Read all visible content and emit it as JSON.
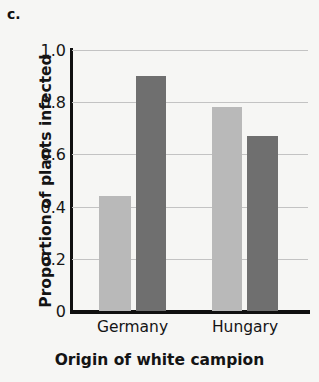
{
  "panel": {
    "label": "c."
  },
  "chart_data": {
    "type": "bar",
    "title": "",
    "subtitle": "",
    "xlabel": "Origin of white campion",
    "ylabel": "Proportion of plants infected",
    "categories": [
      "Germany",
      "Hungary"
    ],
    "series": [
      {
        "name": "light",
        "color": "#b9b9b9",
        "values": [
          0.44,
          0.78
        ]
      },
      {
        "name": "dark",
        "color": "#6f6f6f",
        "values": [
          0.9,
          0.67
        ]
      }
    ],
    "ylim": [
      0,
      1.0
    ],
    "yticks": [
      0,
      0.2,
      0.4,
      0.6,
      0.8,
      1.0
    ],
    "ytick_labels": [
      "0",
      "0.2",
      "0.4",
      "0.6",
      "0.8",
      "1.0"
    ],
    "grid": true,
    "grid_axis": "y",
    "legend": false,
    "legend_position": "none",
    "bars": [
      {
        "category": "Germany",
        "series": "light",
        "value": 0.44,
        "color": "#b9b9b9"
      },
      {
        "category": "Germany",
        "series": "dark",
        "value": 0.9,
        "color": "#6f6f6f"
      },
      {
        "category": "Hungary",
        "series": "light",
        "value": 0.78,
        "color": "#b9b9b9"
      },
      {
        "category": "Hungary",
        "series": "dark",
        "value": 0.67,
        "color": "#6f6f6f"
      }
    ]
  },
  "colors": {
    "background": "#f6f6f4",
    "axis": "#101010",
    "gridline": "#c3c3c3",
    "bar_light": "#b9b9b9",
    "bar_dark": "#6f6f6f",
    "text": "#141414"
  }
}
